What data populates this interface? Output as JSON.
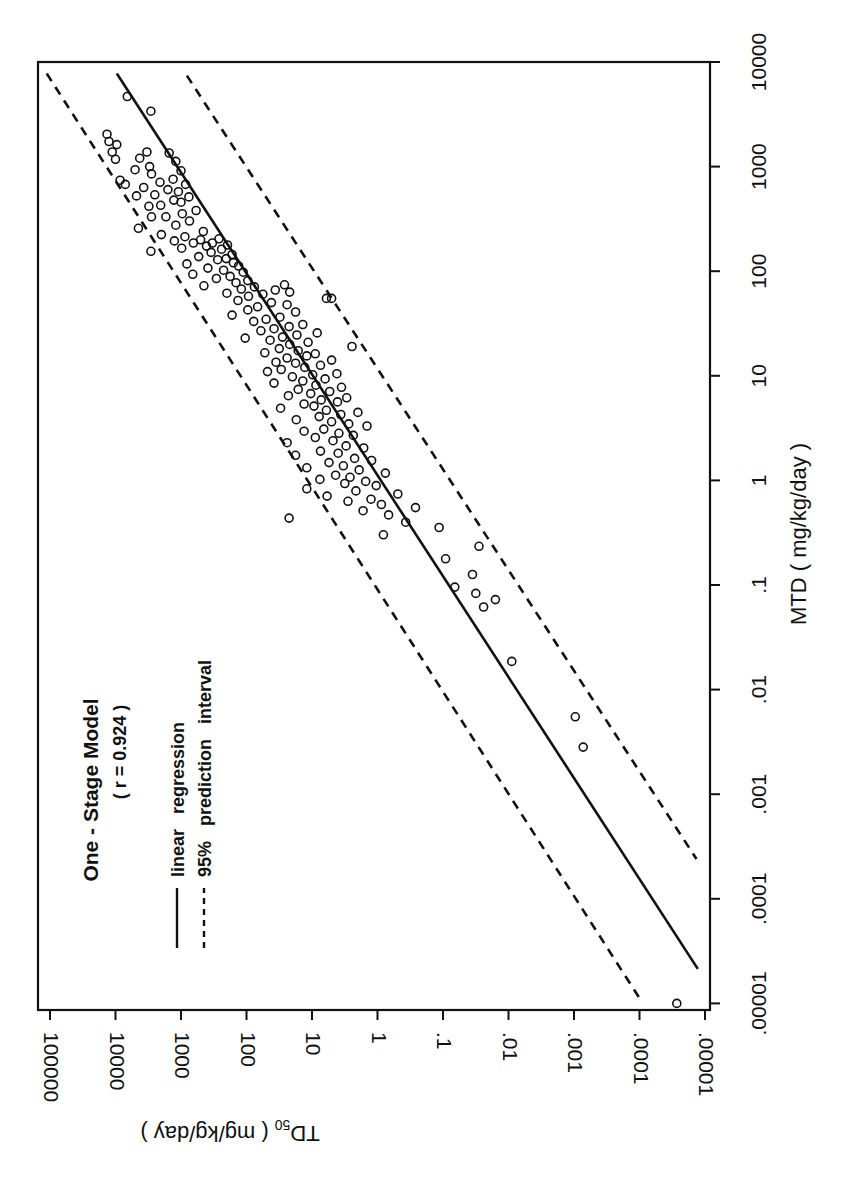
{
  "chart_data": {
    "type": "scatter",
    "orientation_note": "figure printed rotated 90 degrees counter-clockwise",
    "title": "One - Stage Model",
    "subtitle": "( r = 0.924 )",
    "xlabel": "MTD ( mg/kg/day )",
    "ylabel_main": "TD",
    "ylabel_sub": "50",
    "ylabel_rest": " ( mg/kg/day )",
    "x_scale": "log",
    "y_scale": "log",
    "xlim": [
      1e-05,
      10000
    ],
    "ylim": [
      1e-05,
      100000
    ],
    "x_ticks": [
      {
        "v": -5,
        "label": ".00001"
      },
      {
        "v": -4,
        "label": ".0001"
      },
      {
        "v": -3,
        "label": ".001"
      },
      {
        "v": -2,
        "label": ".01"
      },
      {
        "v": -1,
        "label": ".1"
      },
      {
        "v": 0,
        "label": "1"
      },
      {
        "v": 1,
        "label": "10"
      },
      {
        "v": 2,
        "label": "100"
      },
      {
        "v": 3,
        "label": "1000"
      },
      {
        "v": 4,
        "label": "10000"
      }
    ],
    "y_ticks": [
      {
        "v": -5,
        "label": ".00001"
      },
      {
        "v": -4,
        "label": ".0001"
      },
      {
        "v": -3,
        "label": ".001"
      },
      {
        "v": -2,
        "label": ".01"
      },
      {
        "v": -1,
        "label": ".1"
      },
      {
        "v": 0,
        "label": "1"
      },
      {
        "v": 1,
        "label": "10"
      },
      {
        "v": 2,
        "label": "100"
      },
      {
        "v": 3,
        "label": "1000"
      },
      {
        "v": 4,
        "label": "10000"
      },
      {
        "v": 5,
        "label": "100000"
      }
    ],
    "legend": [
      {
        "style": "solid",
        "label": "linear   regression"
      },
      {
        "style": "dashed",
        "label": "95%   prediction   interval"
      }
    ],
    "regression": {
      "log_x_start": 3.89,
      "log_y_start": 3.98,
      "log_x_end": -4.67,
      "log_y_end": -4.89
    },
    "pi_upper": {
      "log_x_start": 3.89,
      "log_y_start": 5.05,
      "log_x_end": -4.95,
      "log_y_end": -4.0
    },
    "pi_lower": {
      "log_x_start": 3.87,
      "log_y_start": 2.91,
      "log_x_end": -3.62,
      "log_y_end": -4.87
    },
    "points_log10": [
      [
        3.67,
        3.82
      ],
      [
        3.53,
        3.46
      ],
      [
        3.31,
        4.13
      ],
      [
        3.24,
        4.1
      ],
      [
        3.21,
        3.98
      ],
      [
        3.14,
        3.52
      ],
      [
        3.14,
        4.05
      ],
      [
        3.13,
        3.18
      ],
      [
        3.08,
        3.63
      ],
      [
        3.07,
        4.0
      ],
      [
        3.05,
        3.08
      ],
      [
        3.0,
        3.48
      ],
      [
        2.97,
        3.7
      ],
      [
        2.96,
        3.0
      ],
      [
        2.93,
        3.45
      ],
      [
        2.88,
        3.12
      ],
      [
        2.87,
        3.93
      ],
      [
        2.85,
        3.32
      ],
      [
        2.83,
        3.85
      ],
      [
        2.83,
        2.93
      ],
      [
        2.8,
        3.57
      ],
      [
        2.78,
        3.2
      ],
      [
        2.76,
        3.04
      ],
      [
        2.73,
        3.4
      ],
      [
        2.72,
        3.68
      ],
      [
        2.71,
        2.88
      ],
      [
        2.68,
        3.11
      ],
      [
        2.66,
        3.0
      ],
      [
        2.63,
        3.31
      ],
      [
        2.62,
        3.49
      ],
      [
        2.58,
        2.77
      ],
      [
        2.55,
        2.98
      ],
      [
        2.52,
        3.23
      ],
      [
        2.52,
        3.45
      ],
      [
        2.48,
        2.87
      ],
      [
        2.44,
        3.08
      ],
      [
        2.41,
        3.65
      ],
      [
        2.38,
        2.66
      ],
      [
        2.35,
        3.3
      ],
      [
        2.33,
        2.94
      ],
      [
        2.31,
        2.42
      ],
      [
        2.3,
        2.7
      ],
      [
        2.29,
        3.1
      ],
      [
        2.27,
        2.52
      ],
      [
        2.27,
        2.81
      ],
      [
        2.25,
        2.29
      ],
      [
        2.24,
        2.61
      ],
      [
        2.22,
        2.99
      ],
      [
        2.21,
        2.38
      ],
      [
        2.19,
        3.46
      ],
      [
        2.18,
        2.54
      ],
      [
        2.16,
        2.22
      ],
      [
        2.14,
        2.73
      ],
      [
        2.12,
        2.31
      ],
      [
        2.11,
        2.44
      ],
      [
        2.08,
        2.2
      ],
      [
        2.07,
        2.91
      ],
      [
        2.05,
        2.12
      ],
      [
        2.03,
        2.59
      ],
      [
        2.01,
        2.35
      ],
      [
        1.99,
        2.05
      ],
      [
        1.97,
        2.82
      ],
      [
        1.95,
        2.25
      ],
      [
        1.93,
        2.46
      ],
      [
        1.91,
        1.98
      ],
      [
        1.89,
        2.16
      ],
      [
        1.87,
        1.42
      ],
      [
        1.86,
        2.65
      ],
      [
        1.85,
        1.88
      ],
      [
        1.83,
        2.08
      ],
      [
        1.82,
        1.56
      ],
      [
        1.8,
        1.34
      ],
      [
        1.79,
        2.3
      ],
      [
        1.78,
        1.75
      ],
      [
        1.76,
        1.97
      ],
      [
        1.74,
        0.78
      ],
      [
        1.74,
        0.7
      ],
      [
        1.72,
        2.13
      ],
      [
        1.7,
        1.62
      ],
      [
        1.68,
        1.38
      ],
      [
        1.66,
        1.83
      ],
      [
        1.63,
        1.98
      ],
      [
        1.61,
        1.25
      ],
      [
        1.58,
        2.22
      ],
      [
        1.56,
        1.49
      ],
      [
        1.54,
        1.7
      ],
      [
        1.52,
        1.89
      ],
      [
        1.49,
        1.14
      ],
      [
        1.47,
        1.35
      ],
      [
        1.45,
        1.58
      ],
      [
        1.43,
        1.78
      ],
      [
        1.41,
        0.92
      ],
      [
        1.39,
        1.23
      ],
      [
        1.37,
        1.45
      ],
      [
        1.36,
        2.02
      ],
      [
        1.34,
        1.64
      ],
      [
        1.32,
        1.06
      ],
      [
        1.3,
        1.34
      ],
      [
        1.28,
        0.39
      ],
      [
        1.26,
        1.5
      ],
      [
        1.24,
        1.21
      ],
      [
        1.22,
        1.72
      ],
      [
        1.21,
        0.95
      ],
      [
        1.19,
        1.08
      ],
      [
        1.17,
        1.38
      ],
      [
        1.15,
        0.7
      ],
      [
        1.13,
        1.55
      ],
      [
        1.12,
        1.25
      ],
      [
        1.1,
        0.87
      ],
      [
        1.08,
        1.11
      ],
      [
        1.06,
        1.47
      ],
      [
        1.04,
        1.68
      ],
      [
        1.02,
        0.62
      ],
      [
        1.01,
        0.99
      ],
      [
        0.99,
        1.3
      ],
      [
        0.97,
        0.8
      ],
      [
        0.95,
        1.14
      ],
      [
        0.93,
        1.58
      ],
      [
        0.91,
        0.94
      ],
      [
        0.89,
        0.55
      ],
      [
        0.87,
        1.21
      ],
      [
        0.85,
        0.73
      ],
      [
        0.83,
        1.02
      ],
      [
        0.81,
        1.36
      ],
      [
        0.79,
        0.47
      ],
      [
        0.77,
        0.86
      ],
      [
        0.75,
        0.61
      ],
      [
        0.73,
        1.12
      ],
      [
        0.71,
        0.97
      ],
      [
        0.69,
        1.48
      ],
      [
        0.67,
        0.78
      ],
      [
        0.65,
        0.3
      ],
      [
        0.63,
        0.56
      ],
      [
        0.61,
        0.89
      ],
      [
        0.58,
        1.24
      ],
      [
        0.56,
        0.7
      ],
      [
        0.54,
        0.44
      ],
      [
        0.52,
        0.16
      ],
      [
        0.49,
        0.82
      ],
      [
        0.47,
        1.12
      ],
      [
        0.45,
        0.59
      ],
      [
        0.43,
        0.37
      ],
      [
        0.41,
        0.95
      ],
      [
        0.38,
        0.68
      ],
      [
        0.36,
        1.38
      ],
      [
        0.33,
        0.48
      ],
      [
        0.31,
        0.21
      ],
      [
        0.28,
        0.87
      ],
      [
        0.26,
        0.6
      ],
      [
        0.24,
        1.25
      ],
      [
        0.21,
        0.35
      ],
      [
        0.19,
        0.09
      ],
      [
        0.17,
        0.74
      ],
      [
        0.14,
        0.52
      ],
      [
        0.12,
        1.08
      ],
      [
        0.1,
        0.28
      ],
      [
        0.07,
        -0.12
      ],
      [
        0.05,
        0.64
      ],
      [
        0.03,
        0.42
      ],
      [
        0.01,
        0.88
      ],
      [
        -0.01,
        0.18
      ],
      [
        -0.03,
        0.5
      ],
      [
        -0.05,
        0.02
      ],
      [
        -0.08,
        1.08
      ],
      [
        -0.1,
        0.33
      ],
      [
        -0.13,
        -0.31
      ],
      [
        -0.15,
        0.77
      ],
      [
        -0.18,
        0.1
      ],
      [
        -0.2,
        0.45
      ],
      [
        -0.23,
        -0.06
      ],
      [
        -0.26,
        -0.58
      ],
      [
        -0.29,
        0.22
      ],
      [
        -0.33,
        -0.17
      ],
      [
        -0.36,
        1.35
      ],
      [
        -0.4,
        -0.43
      ],
      [
        -0.45,
        -0.94
      ],
      [
        -0.52,
        -0.09
      ],
      [
        -0.63,
        -1.55
      ],
      [
        -0.75,
        -1.04
      ],
      [
        -0.9,
        -1.45
      ],
      [
        -1.02,
        -1.18
      ],
      [
        -1.08,
        -1.5
      ],
      [
        -1.14,
        -1.8
      ],
      [
        -1.21,
        -1.62
      ],
      [
        -1.73,
        -2.05
      ],
      [
        -2.26,
        -3.02
      ],
      [
        -2.55,
        -3.14
      ],
      [
        -5.0,
        -4.57
      ]
    ]
  }
}
